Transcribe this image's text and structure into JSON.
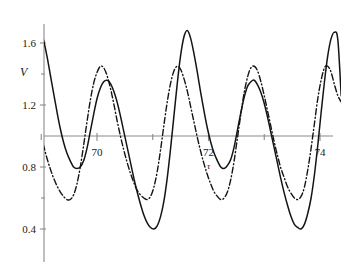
{
  "chart_data": {
    "type": "line",
    "title": "",
    "xlabel": "τ",
    "ylabel": "V",
    "xlim": [
      68.74,
      74.38
    ],
    "ylim": [
      0.23,
      1.8
    ],
    "grid": false,
    "legend": "none",
    "xticks_major": [
      70,
      72,
      74
    ],
    "xtick_labels": [
      "70",
      "72",
      "74"
    ],
    "xticks_minor": [
      69,
      71,
      73
    ],
    "yticks_major": [
      0.4,
      0.8,
      1.2,
      1.6
    ],
    "ytick_labels": [
      "0.4",
      "0.8",
      "1.2",
      "1.6"
    ],
    "yticks_minor": [
      0.6,
      1.0,
      1.4
    ],
    "baseline_y": 1.0,
    "axis_color": "#8a8a8a",
    "curve_color": "#141414",
    "series": [
      {
        "name": "solid",
        "style": "solid",
        "description": "period-doubled oscillation with alternating tall and short peaks",
        "period": 1.26,
        "peaks_tall": 1.68,
        "peaks_short": 1.36,
        "troughs_shallow": 0.79,
        "troughs_deep": 0.4,
        "x": [
          68.74,
          68.8,
          68.86,
          68.92,
          68.98,
          69.04,
          69.1,
          69.16,
          69.22,
          69.28,
          69.34,
          69.4,
          69.46,
          69.52,
          69.58,
          69.64,
          69.7,
          69.76,
          69.82,
          69.88,
          69.94,
          70.0,
          70.06,
          70.12,
          70.18,
          70.24,
          70.3,
          70.36,
          70.42,
          70.48,
          70.54,
          70.6,
          70.66,
          70.72,
          70.78,
          70.84,
          70.9,
          70.96,
          71.02,
          71.08,
          71.14,
          71.2,
          71.26,
          71.32,
          71.38,
          71.44,
          71.5,
          71.56,
          71.62,
          71.68,
          71.74,
          71.8,
          71.86,
          71.92,
          71.98,
          72.04,
          72.1,
          72.16,
          72.22,
          72.28,
          72.34,
          72.4,
          72.46,
          72.52,
          72.58,
          72.64,
          72.7,
          72.76,
          72.82,
          72.88,
          72.94,
          73.0,
          73.06,
          73.12,
          73.18,
          73.24,
          73.3,
          73.36,
          73.42,
          73.48,
          73.54,
          73.6,
          73.66,
          73.72,
          73.78,
          73.84,
          73.9,
          73.96,
          74.02,
          74.08,
          74.14,
          74.2,
          74.26,
          74.32,
          74.38
        ],
        "y": [
          1.3,
          1.45,
          1.58,
          1.66,
          1.68,
          1.62,
          1.52,
          1.4,
          1.28,
          1.16,
          1.05,
          0.96,
          0.89,
          0.84,
          0.8,
          0.79,
          0.8,
          0.84,
          0.92,
          1.03,
          1.14,
          1.24,
          1.31,
          1.35,
          1.36,
          1.34,
          1.29,
          1.22,
          1.13,
          1.03,
          0.93,
          0.83,
          0.73,
          0.64,
          0.56,
          0.49,
          0.44,
          0.41,
          0.4,
          0.42,
          0.48,
          0.58,
          0.73,
          0.92,
          1.13,
          1.34,
          1.52,
          1.64,
          1.68,
          1.63,
          1.53,
          1.41,
          1.28,
          1.16,
          1.05,
          0.96,
          0.89,
          0.84,
          0.8,
          0.79,
          0.81,
          0.85,
          0.93,
          1.04,
          1.15,
          1.25,
          1.32,
          1.35,
          1.36,
          1.33,
          1.28,
          1.21,
          1.12,
          1.02,
          0.92,
          0.82,
          0.72,
          0.63,
          0.55,
          0.48,
          0.43,
          0.41,
          0.4,
          0.43,
          0.5,
          0.6,
          0.75,
          0.94,
          1.15,
          1.35,
          1.52,
          1.63,
          1.67,
          1.62,
          1.26
        ]
      },
      {
        "name": "dash-dot",
        "style": "dashdot",
        "description": "oscillation with uniform peaks, phase-shifted relative to solid curve",
        "period": 1.26,
        "peaks": 1.45,
        "troughs": 0.59,
        "x": [
          68.74,
          68.8,
          68.86,
          68.92,
          68.98,
          69.04,
          69.1,
          69.16,
          69.22,
          69.28,
          69.34,
          69.4,
          69.46,
          69.52,
          69.58,
          69.64,
          69.7,
          69.76,
          69.82,
          69.88,
          69.94,
          70.0,
          70.06,
          70.12,
          70.18,
          70.24,
          70.3,
          70.36,
          70.42,
          70.48,
          70.54,
          70.6,
          70.66,
          70.72,
          70.78,
          70.84,
          70.9,
          70.96,
          71.02,
          71.08,
          71.14,
          71.2,
          71.26,
          71.32,
          71.38,
          71.44,
          71.5,
          71.56,
          71.62,
          71.68,
          71.74,
          71.8,
          71.86,
          71.92,
          71.98,
          72.04,
          72.1,
          72.16,
          72.22,
          72.28,
          72.34,
          72.4,
          72.46,
          72.52,
          72.58,
          72.64,
          72.7,
          72.76,
          72.82,
          72.88,
          72.94,
          73.0,
          73.06,
          73.12,
          73.18,
          73.24,
          73.3,
          73.36,
          73.42,
          73.48,
          73.54,
          73.6,
          73.66,
          73.72,
          73.78,
          73.84,
          73.9,
          73.96,
          74.02,
          74.08,
          74.14,
          74.2,
          74.26,
          74.32,
          74.38
        ],
        "y": [
          1.24,
          1.22,
          1.17,
          1.1,
          1.02,
          0.94,
          0.86,
          0.79,
          0.73,
          0.68,
          0.64,
          0.61,
          0.59,
          0.59,
          0.62,
          0.69,
          0.8,
          0.94,
          1.09,
          1.23,
          1.34,
          1.41,
          1.45,
          1.44,
          1.39,
          1.31,
          1.21,
          1.1,
          1.0,
          0.91,
          0.83,
          0.76,
          0.7,
          0.65,
          0.62,
          0.6,
          0.59,
          0.61,
          0.67,
          0.77,
          0.91,
          1.07,
          1.22,
          1.34,
          1.42,
          1.45,
          1.43,
          1.37,
          1.29,
          1.19,
          1.09,
          0.99,
          0.9,
          0.82,
          0.75,
          0.69,
          0.64,
          0.61,
          0.59,
          0.6,
          0.64,
          0.72,
          0.84,
          0.99,
          1.14,
          1.28,
          1.38,
          1.44,
          1.45,
          1.42,
          1.35,
          1.26,
          1.16,
          1.06,
          0.96,
          0.87,
          0.79,
          0.73,
          0.67,
          0.63,
          0.6,
          0.59,
          0.61,
          0.67,
          0.78,
          0.92,
          1.08,
          1.24,
          1.36,
          1.44,
          1.45,
          1.41,
          1.33,
          1.26,
          1.22
        ]
      }
    ]
  }
}
